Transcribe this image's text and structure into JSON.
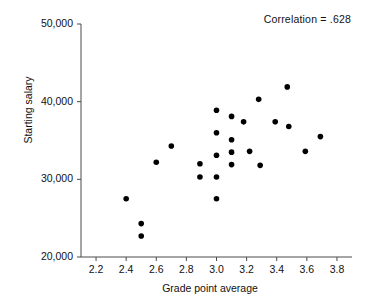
{
  "chart_data": {
    "type": "scatter",
    "title": "",
    "xlabel": "Grade point average",
    "ylabel": "Starting salary",
    "xlim": [
      2.1,
      3.9
    ],
    "ylim": [
      20000,
      50000
    ],
    "xticks": [
      "2.2",
      "2.4",
      "2.6",
      "2.8",
      "3.0",
      "3.2",
      "3.4",
      "3.6",
      "3.8"
    ],
    "xtick_values": [
      2.2,
      2.4,
      2.6,
      2.8,
      3.0,
      3.2,
      3.4,
      3.6,
      3.8
    ],
    "yticks": [
      "20,000",
      "30,000",
      "40,000",
      "50,000"
    ],
    "ytick_values": [
      20000,
      30000,
      40000,
      50000
    ],
    "grid": false,
    "legend": null,
    "annotation": "Correlation = .628",
    "correlation": 0.628,
    "marker": "filled-circle",
    "marker_color": "#000000",
    "points": [
      {
        "x": 2.4,
        "y": 27500
      },
      {
        "x": 2.5,
        "y": 24300
      },
      {
        "x": 2.5,
        "y": 22700
      },
      {
        "x": 2.6,
        "y": 32200
      },
      {
        "x": 2.7,
        "y": 34300
      },
      {
        "x": 2.89,
        "y": 32000
      },
      {
        "x": 2.89,
        "y": 30300
      },
      {
        "x": 3.0,
        "y": 38900
      },
      {
        "x": 3.0,
        "y": 36000
      },
      {
        "x": 3.0,
        "y": 33100
      },
      {
        "x": 3.0,
        "y": 30300
      },
      {
        "x": 3.0,
        "y": 27500
      },
      {
        "x": 3.1,
        "y": 38100
      },
      {
        "x": 3.1,
        "y": 35100
      },
      {
        "x": 3.1,
        "y": 33500
      },
      {
        "x": 3.1,
        "y": 31900
      },
      {
        "x": 3.18,
        "y": 37400
      },
      {
        "x": 3.22,
        "y": 33600
      },
      {
        "x": 3.28,
        "y": 40300
      },
      {
        "x": 3.29,
        "y": 31800
      },
      {
        "x": 3.39,
        "y": 37400
      },
      {
        "x": 3.47,
        "y": 41900
      },
      {
        "x": 3.48,
        "y": 36800
      },
      {
        "x": 3.59,
        "y": 33600
      },
      {
        "x": 3.69,
        "y": 35500
      }
    ]
  }
}
